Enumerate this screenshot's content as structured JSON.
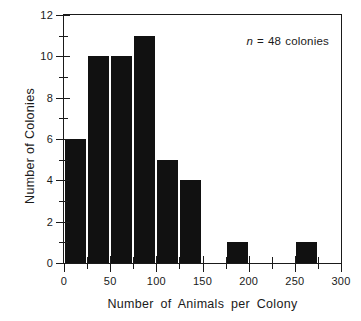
{
  "chart_data": {
    "type": "bar",
    "title": "",
    "subtitle": "",
    "xlabel": "Number of Animals per Colony",
    "ylabel": "Number of Colonies",
    "xlim": [
      0,
      300
    ],
    "ylim": [
      0,
      12
    ],
    "grid": false,
    "legend": null,
    "bin_width": 25,
    "categories": [
      "0-25",
      "25-50",
      "50-75",
      "75-100",
      "100-125",
      "125-150",
      "150-175",
      "175-200",
      "200-225",
      "225-250",
      "250-275",
      "275-300"
    ],
    "bin_edges": [
      0,
      25,
      50,
      75,
      100,
      125,
      150,
      175,
      200,
      225,
      250,
      275,
      300
    ],
    "values": [
      6,
      10,
      10,
      11,
      5,
      4,
      0,
      1,
      0,
      0,
      1,
      0
    ],
    "x_ticks_major": [
      0,
      50,
      100,
      150,
      200,
      250,
      300
    ],
    "x_ticks_major_labels": [
      "0",
      "50",
      "100",
      "150",
      "200",
      "250",
      "300"
    ],
    "x_ticks_minor": [
      25,
      75,
      125,
      175,
      225,
      275
    ],
    "y_ticks_major": [
      0,
      2,
      4,
      6,
      8,
      10,
      12
    ],
    "y_ticks_major_labels": [
      "0",
      "2",
      "4",
      "6",
      "8",
      "10",
      "12"
    ],
    "y_ticks_minor": [
      1,
      3,
      5,
      7,
      9,
      11
    ],
    "annotations": [
      {
        "name": "sample-size",
        "text": "n = 48 colonies",
        "variable": "n",
        "equals": "=",
        "value": "48",
        "unit": "colonies",
        "position": "top-right"
      }
    ],
    "colors": {
      "bar": "#111111",
      "axis": "#1a1a1a",
      "background": "#ffffff",
      "text": "#1a1a1a"
    }
  }
}
